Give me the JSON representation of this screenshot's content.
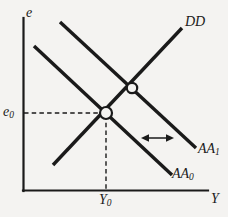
{
  "figure": {
    "kind": "aa-dd-diagram",
    "background_color": "#f4f3f1",
    "ink_color": "#1a1a1a",
    "axes": {
      "y_axis_label": "e",
      "x_axis_label": "Y",
      "origin": {
        "x": 23,
        "y": 191
      },
      "y_axis_top": {
        "x": 23,
        "y": 18
      },
      "x_axis_right": {
        "x": 208,
        "y": 191
      }
    },
    "tick_labels": {
      "y_equilibrium": "e",
      "y_equilibrium_sub": "0",
      "x_equilibrium": "Y",
      "x_equilibrium_sub": "0"
    },
    "curves": [
      {
        "name": "DD",
        "label": "DD",
        "label_sub": "",
        "slope_direction": "upward",
        "start": {
          "x": 53,
          "y": 165
        },
        "end": {
          "x": 182,
          "y": 28
        }
      },
      {
        "name": "AA1",
        "label": "AA",
        "label_sub": "1",
        "slope_direction": "downward",
        "start": {
          "x": 60,
          "y": 22
        },
        "end": {
          "x": 196,
          "y": 148
        }
      },
      {
        "name": "AA0",
        "label": "AA",
        "label_sub": "0",
        "slope_direction": "downward",
        "start": {
          "x": 34,
          "y": 46
        },
        "end": {
          "x": 172,
          "y": 175
        }
      }
    ],
    "equilibria": [
      {
        "name": "initial-equilibrium",
        "x": 106,
        "y": 113,
        "radius": 6.0,
        "curves": [
          "AA0",
          "DD"
        ]
      },
      {
        "name": "new-equilibrium",
        "x": 132,
        "y": 88,
        "radius": 5.2,
        "curves": [
          "AA1",
          "DD"
        ]
      }
    ],
    "guide_lines": [
      {
        "name": "horizontal-guide-e0",
        "from": {
          "x": 23,
          "y": 113
        },
        "to": {
          "x": 106,
          "y": 113
        }
      },
      {
        "name": "vertical-guide-Y0",
        "from": {
          "x": 106,
          "y": 113
        },
        "to": {
          "x": 106,
          "y": 191
        }
      }
    ],
    "shift_arrow": {
      "name": "aa-shift-arrow",
      "y": 138,
      "x_start": 142,
      "x_end": 173,
      "double_headed": true
    }
  }
}
